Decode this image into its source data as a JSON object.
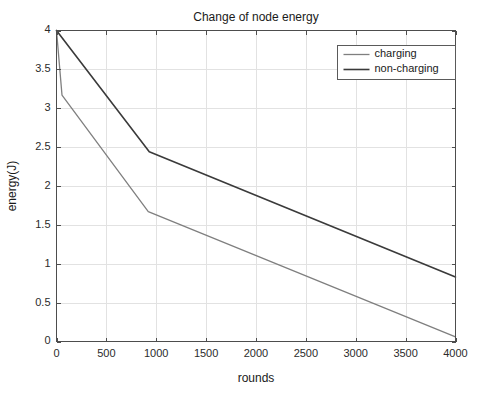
{
  "chart_data": {
    "type": "line",
    "title": "Change of node energy",
    "xlabel": "rounds",
    "ylabel": "energy(J)",
    "xlim": [
      0,
      4000
    ],
    "ylim": [
      0,
      4
    ],
    "xticks": [
      0,
      500,
      1000,
      1500,
      2000,
      2500,
      3000,
      3500,
      4000
    ],
    "xticklabels": [
      "0",
      "500",
      "1000",
      "1500",
      "2000",
      "2500",
      "3000",
      "3500",
      "4000"
    ],
    "yticks": [
      0,
      0.5,
      1,
      1.5,
      2,
      2.5,
      3,
      3.5,
      4
    ],
    "yticklabels": [
      "0",
      "0.5",
      "1",
      "1.5",
      "2",
      "2.5",
      "3",
      "3.5",
      "4"
    ],
    "grid": true,
    "legend_position": "upper right",
    "series": [
      {
        "name": "charging",
        "color": "#7f7f7f",
        "linewidth": 1.3,
        "x": [
          0,
          55,
          920,
          4000
        ],
        "y": [
          4.0,
          3.17,
          1.67,
          0.06
        ]
      },
      {
        "name": "non-charging",
        "color": "#3a3a3a",
        "linewidth": 1.6,
        "x": [
          0,
          930,
          4000
        ],
        "y": [
          4.0,
          2.44,
          0.83
        ]
      }
    ]
  },
  "legend": {
    "entries": [
      {
        "label": "charging"
      },
      {
        "label": "non-charging"
      }
    ]
  },
  "colors": {
    "axis": "#4d4d4d",
    "grid": "#e2e2e2",
    "background": "#ffffff",
    "text": "#1a1a1a"
  }
}
